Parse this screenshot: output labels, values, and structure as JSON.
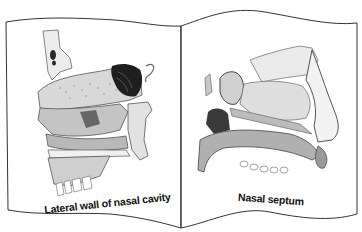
{
  "figure": {
    "type": "open-book-anatomical-illustration",
    "style": "grayscale line drawing",
    "colors": {
      "background": "#ffffff",
      "page_outline": "#333333",
      "bone_light": "#e6e6e6",
      "bone_mid": "#bdbdbd",
      "bone_dark": "#7a7a7a",
      "cavity_dark": "#1e1e1e",
      "caption_text": "#111111"
    }
  },
  "pages": {
    "left": {
      "caption": "Lateral wall of nasal cavity",
      "illustration": "lateral-wall-nasal-cavity"
    },
    "right": {
      "caption": "Nasal septum",
      "illustration": "nasal-septum"
    }
  }
}
